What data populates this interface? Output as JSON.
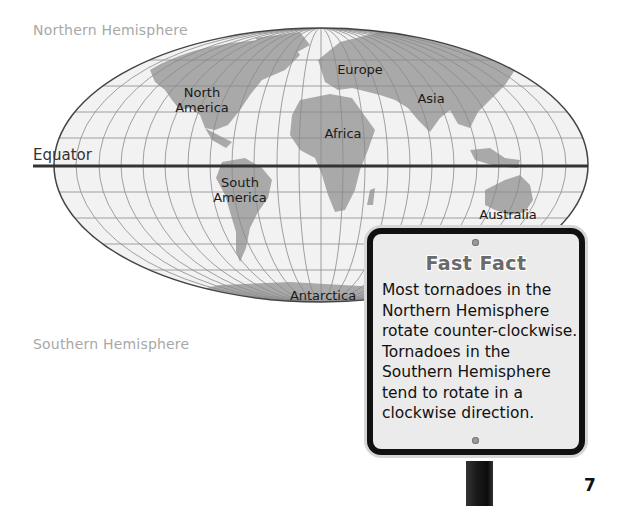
{
  "labels": {
    "northern_hemisphere": "Northern Hemisphere",
    "southern_hemisphere": "Southern Hemisphere",
    "equator": "Equator"
  },
  "continents": {
    "north_america": [
      "North",
      "America"
    ],
    "europe": "Europe",
    "asia": "Asia",
    "africa": "Africa",
    "south_america": [
      "South",
      "America"
    ],
    "australia": "Australia",
    "antarctica": "Antarctica"
  },
  "fast_fact": {
    "title": "Fast Fact",
    "lines": [
      "Most tornadoes in the",
      "Northern Hemisphere",
      "rotate counter-clockwise.",
      "Tornadoes in the",
      "Southern Hemisphere",
      "tend to rotate in a",
      "clockwise direction."
    ]
  },
  "page_number": "7",
  "colors": {
    "ocean": "#f2f2f2",
    "land": "#a9a9a9",
    "grid": "#8a8a8a",
    "outline": "#444444",
    "equator_line": "#333333",
    "hemisphere_text": "#a8a8a8"
  }
}
